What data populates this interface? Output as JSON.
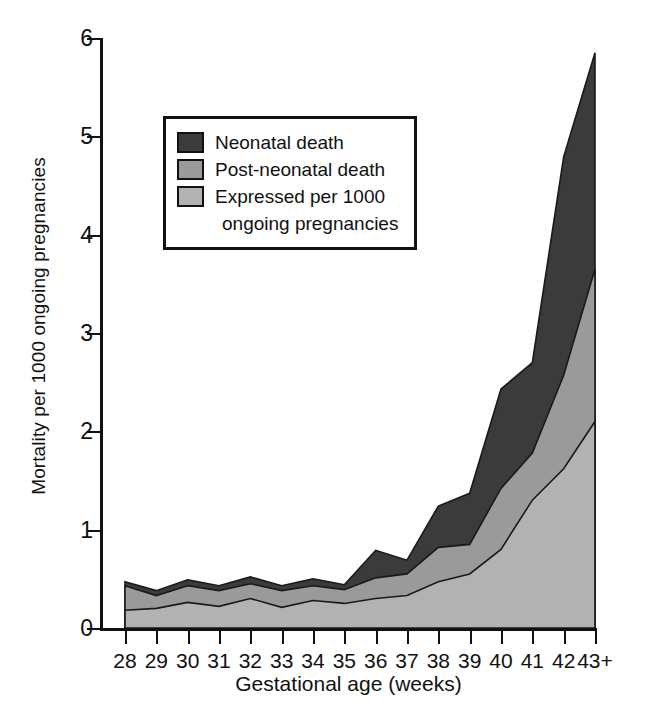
{
  "chart_data": {
    "type": "area",
    "stacked": true,
    "title": "",
    "xlabel": "Gestational age (weeks)",
    "ylabel": "Mortality per 1000 ongoing pregnancies",
    "categories": [
      "28",
      "29",
      "30",
      "31",
      "32",
      "33",
      "34",
      "35",
      "36",
      "37",
      "38",
      "39",
      "40",
      "41",
      "42",
      "43+"
    ],
    "xtick_labels": [
      "28",
      "29",
      "30",
      "31",
      "32",
      "33",
      "34",
      "35",
      "36",
      "37",
      "38",
      "39",
      "40",
      "41",
      "42",
      "43+"
    ],
    "ytick_labels": [
      "0",
      "1",
      "2",
      "3",
      "4",
      "5",
      "6"
    ],
    "yticks": [
      0,
      1,
      2,
      3,
      4,
      5,
      6
    ],
    "ylim": [
      0,
      6
    ],
    "grid": false,
    "legend_position": "upper-left-inside",
    "series": [
      {
        "name": "Expressed per 1000 ongoing pregnancies",
        "color": "#b2b2b2",
        "values": [
          0.18,
          0.2,
          0.26,
          0.22,
          0.3,
          0.21,
          0.28,
          0.25,
          0.3,
          0.33,
          0.47,
          0.55,
          0.8,
          1.3,
          1.62,
          2.1
        ]
      },
      {
        "name": "Post-neonatal death",
        "color": "#9a9a9a",
        "values": [
          0.25,
          0.13,
          0.17,
          0.16,
          0.15,
          0.17,
          0.15,
          0.14,
          0.21,
          0.22,
          0.35,
          0.3,
          0.62,
          0.48,
          0.95,
          1.55
        ]
      },
      {
        "name": "Neonatal death",
        "color": "#3b3b3b",
        "values": [
          0.04,
          0.05,
          0.06,
          0.05,
          0.07,
          0.05,
          0.07,
          0.05,
          0.28,
          0.14,
          0.42,
          0.52,
          1.01,
          0.92,
          2.22,
          2.2
        ]
      }
    ],
    "cumulative_tops": {
      "expressed_per_1000": [
        0.18,
        0.2,
        0.26,
        0.22,
        0.3,
        0.21,
        0.28,
        0.25,
        0.3,
        0.33,
        0.47,
        0.55,
        0.8,
        1.3,
        1.62,
        2.1
      ],
      "post_neonatal_death": [
        0.43,
        0.33,
        0.43,
        0.38,
        0.45,
        0.38,
        0.43,
        0.39,
        0.51,
        0.55,
        0.82,
        0.85,
        1.42,
        1.78,
        2.57,
        3.65
      ],
      "neonatal_death": [
        0.47,
        0.38,
        0.49,
        0.43,
        0.52,
        0.43,
        0.5,
        0.44,
        0.79,
        0.69,
        1.24,
        1.37,
        2.43,
        2.7,
        4.79,
        5.85
      ]
    }
  },
  "legend": {
    "entries": [
      {
        "label": "Neonatal death",
        "color": "#3b3b3b"
      },
      {
        "label": "Post-neonatal death",
        "color": "#9a9a9a"
      },
      {
        "label": "Expressed per 1000",
        "color": "#b2b2b2"
      }
    ],
    "continuation": "ongoing pregnancies"
  },
  "axis": {
    "x_title": "Gestational age (weeks)",
    "y_title": "Mortality per 1000 ongoing pregnancies"
  },
  "caption": ""
}
